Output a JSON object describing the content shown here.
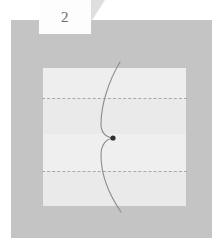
{
  "figure": {
    "label": "2",
    "label_position": "top-left",
    "background_color": "#c4c4c4",
    "plot_background_color": "#ededed",
    "curve_color": "#8c8c8c",
    "dash_color": "#a9a9a9",
    "point_color": "#303030"
  },
  "chart_data": {
    "type": "line",
    "title": "2",
    "xlabel": "",
    "ylabel": "",
    "xlim": [
      0,
      143
    ],
    "ylim": [
      0,
      138
    ],
    "grid": false,
    "legend": null,
    "bands": [
      {
        "name": "band-0",
        "y_start": 0,
        "y_end": 30,
        "color": "#eeeeee"
      },
      {
        "name": "band-1",
        "y_start": 30,
        "y_end": 66,
        "color": "#eaeaea"
      },
      {
        "name": "band-2",
        "y_start": 66,
        "y_end": 103,
        "color": "#efefef"
      },
      {
        "name": "band-3",
        "y_start": 103,
        "y_end": 138,
        "color": "#eaeaea"
      }
    ],
    "reference_lines": [
      {
        "name": "dashed-line-upper",
        "orientation": "horizontal",
        "y": 30,
        "style": "dashed"
      },
      {
        "name": "dashed-line-lower",
        "orientation": "horizontal",
        "y": 103,
        "style": "dashed"
      }
    ],
    "series": [
      {
        "name": "cusped-curve",
        "style": "solid",
        "color": "#8c8c8c",
        "path": "M120,62 C108,82 101,106 101,124 C101,133 106,137 113,138 C106,139 101,145 101,155 C101,175 110,196 121,212"
      }
    ],
    "annotations": [
      {
        "name": "cusp-point",
        "type": "point",
        "x": 113,
        "y": 138,
        "color": "#303030",
        "radius": 2.6
      }
    ]
  }
}
